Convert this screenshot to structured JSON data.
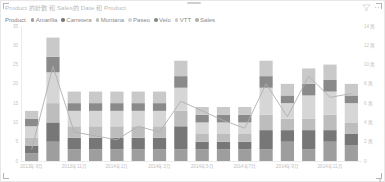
{
  "visual": {
    "title": "Product 的計數 和 Sales的 Date 和 Product",
    "header_icons": [
      {
        "name": "filter-icon",
        "glyph": "filter"
      },
      {
        "name": "more-options-icon",
        "glyph": "ellipsis"
      },
      {
        "name": "focus-mode-icon",
        "glyph": "expand"
      }
    ]
  },
  "legend": {
    "title": "Product",
    "position": "top",
    "items": [
      {
        "label": "Amarilla",
        "color": "#9e9e9e"
      },
      {
        "label": "Carretera",
        "color": "#777777"
      },
      {
        "label": "Montana",
        "color": "#bdbdbd"
      },
      {
        "label": "Paseo",
        "color": "#d6d6d6"
      },
      {
        "label": "Velo",
        "color": "#8a8a8a"
      },
      {
        "label": "VTT",
        "color": "#c9c9c9"
      },
      {
        "label": "Sales",
        "color": "#b0b0b0"
      }
    ]
  },
  "chart_data": {
    "type": "bar",
    "subtype": "stacked-column-with-line",
    "title": "Product 的計數 和 Sales的 Date 和 Product",
    "xlabel": "Date",
    "ylabel": "Product 的計數",
    "y2label": "Sales",
    "grid": false,
    "legend_position": "top",
    "categories": [
      "2013年9月",
      "2013年10月",
      "2013年11月",
      "2013年12月",
      "2014年1月",
      "2014年2月",
      "2014年3月",
      "2014年4月",
      "2014年5月",
      "2014年6月",
      "2014年7月",
      "2014年8月",
      "2014年9月",
      "2014年10月",
      "2014年11月",
      "2014年12月"
    ],
    "xtick_labels": [
      "2013年9月",
      "2013年11月",
      "2014年1月",
      "2014年3月",
      "2014年5月",
      "2014年7月",
      "2014年9月",
      "2014年11月"
    ],
    "xtick_indices": [
      0,
      2,
      4,
      6,
      8,
      10,
      12,
      14
    ],
    "ylim": [
      0,
      35
    ],
    "ytick_labels": [
      "0",
      "5",
      "10",
      "15",
      "20",
      "25",
      "30",
      "35"
    ],
    "ytick_values": [
      0,
      5,
      10,
      15,
      20,
      25,
      30,
      35
    ],
    "y2lim": [
      0,
      140000
    ],
    "y2tick_labels": [
      "0",
      "2 萬",
      "4 萬",
      "6 萬",
      "8 萬",
      "10 萬",
      "12 萬",
      "14 萬"
    ],
    "y2tick_values": [
      0,
      20000,
      40000,
      60000,
      80000,
      100000,
      120000,
      140000
    ],
    "series": [
      {
        "name": "Amarilla",
        "color": "#9e9e9e",
        "values": [
          2,
          5,
          3,
          3,
          3,
          3,
          3,
          3,
          3,
          3,
          3,
          3,
          5,
          3,
          5,
          4
        ]
      },
      {
        "name": "Carretera",
        "color": "#777777",
        "values": [
          2,
          5,
          3,
          3,
          3,
          3,
          3,
          6,
          2,
          2,
          2,
          5,
          3,
          5,
          3,
          3
        ]
      },
      {
        "name": "Montana",
        "color": "#bdbdbd",
        "values": [
          2,
          5,
          3,
          3,
          3,
          3,
          3,
          4,
          2,
          2,
          2,
          4,
          3,
          3,
          4,
          3
        ]
      },
      {
        "name": "Paseo",
        "color": "#d6d6d6",
        "values": [
          3,
          8,
          4,
          4,
          4,
          4,
          4,
          6,
          3,
          3,
          3,
          7,
          4,
          6,
          6,
          5
        ]
      },
      {
        "name": "Velo",
        "color": "#8a8a8a",
        "values": [
          2,
          4,
          2,
          2,
          2,
          2,
          2,
          3,
          2,
          2,
          2,
          3,
          2,
          3,
          3,
          2
        ]
      },
      {
        "name": "VTT",
        "color": "#c9c9c9",
        "values": [
          2,
          5,
          3,
          3,
          3,
          3,
          3,
          4,
          2,
          2,
          2,
          4,
          3,
          4,
          4,
          3
        ]
      }
    ],
    "line_series": {
      "name": "Sales",
      "color": "#b0b0b0",
      "axis": "right",
      "values": [
        12000,
        98000,
        30000,
        26000,
        22000,
        36000,
        30000,
        62000,
        52000,
        42000,
        34000,
        80000,
        46000,
        88000,
        66000,
        70000
      ]
    }
  }
}
